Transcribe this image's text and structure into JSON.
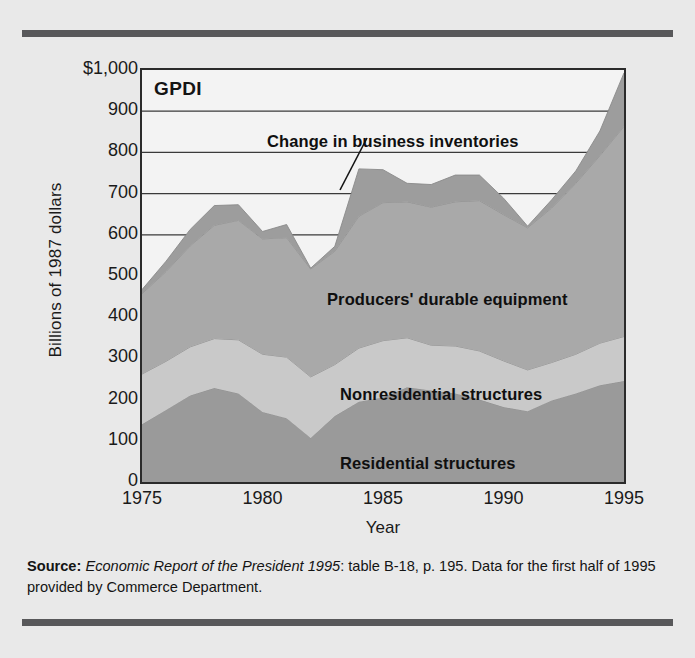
{
  "figure": {
    "y_axis_title": "Billions of 1987 dollars",
    "x_axis_title": "Year",
    "plot_tag": "GPDI"
  },
  "source_note": {
    "label": "Source:",
    "italic_part": "Economic Report of the President 1995",
    "rest": ": table B-18, p. 195. Data for the first half of 1995 provided by Commerce Department."
  },
  "annotations": {
    "inventories": "Change in business inventories",
    "pde": "Producers' durable equipment",
    "nonresidential": "Nonresidential structures",
    "residential": "Residential structures"
  },
  "colors": {
    "page_background": "#e9e9e9",
    "rule": "#58585a",
    "plot_background": "#f3f3f3",
    "axis": "#2b2b2b",
    "gridline": "#3a3a3a",
    "residential": "#9a9a9a",
    "nonresidential": "#c9c9c9",
    "producers_durable_equipment": "#a9a9a9",
    "inventories": "#9d9d9d",
    "text": "#1a1a1a"
  },
  "chart_data": {
    "type": "area",
    "stacked": true,
    "title": "GPDI",
    "xlabel": "Year",
    "ylabel": "Billions of 1987 dollars",
    "ylim": [
      0,
      1000
    ],
    "xlim": [
      1975,
      1995
    ],
    "ytick_labels": [
      "$1,000",
      "900",
      "800",
      "700",
      "600",
      "500",
      "400",
      "300",
      "200",
      "100",
      "0"
    ],
    "ytick_values": [
      1000,
      900,
      800,
      700,
      600,
      500,
      400,
      300,
      200,
      100,
      0
    ],
    "xtick_labels": [
      "1975",
      "1980",
      "1985",
      "1990",
      "1995"
    ],
    "xtick_values": [
      1975,
      1980,
      1985,
      1990,
      1995
    ],
    "gridlines_at": [
      900,
      800,
      700,
      600
    ],
    "grid": true,
    "legend_position": "inline-annotations",
    "x": [
      1975,
      1976,
      1977,
      1978,
      1979,
      1980,
      1981,
      1982,
      1983,
      1984,
      1985,
      1986,
      1987,
      1988,
      1989,
      1990,
      1991,
      1992,
      1993,
      1994,
      1995
    ],
    "series": [
      {
        "name": "Residential structures",
        "values": [
          140,
          175,
          210,
          228,
          215,
          170,
          155,
          107,
          160,
          195,
          205,
          230,
          222,
          215,
          200,
          182,
          172,
          198,
          215,
          235,
          245
        ]
      },
      {
        "name": "Nonresidential structures",
        "values": [
          122,
          118,
          118,
          120,
          130,
          140,
          148,
          148,
          125,
          130,
          138,
          120,
          110,
          115,
          118,
          112,
          100,
          92,
          95,
          102,
          108
        ]
      },
      {
        "name": "Producers' durable equipment",
        "values": [
          195,
          218,
          245,
          275,
          290,
          280,
          290,
          262,
          275,
          320,
          335,
          330,
          335,
          350,
          365,
          355,
          345,
          375,
          415,
          455,
          510
        ]
      },
      {
        "name": "Change in business inventories",
        "values": [
          10,
          25,
          40,
          48,
          38,
          18,
          32,
          2,
          12,
          115,
          80,
          45,
          55,
          65,
          62,
          40,
          4,
          20,
          30,
          60,
          130
        ]
      }
    ],
    "stacked_totals": [
      467,
      536,
      613,
      671,
      673,
      608,
      625,
      519,
      572,
      760,
      758,
      725,
      722,
      745,
      745,
      689,
      621,
      685,
      755,
      852,
      993
    ]
  }
}
